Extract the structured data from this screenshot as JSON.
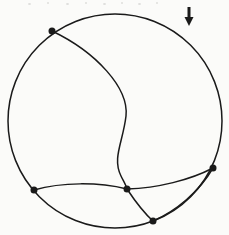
{
  "figure": {
    "name": "circle-graph-diagram",
    "background_color": "#fbfbf9",
    "ink_color": "#1a1a1a",
    "stroke_width": 1.5,
    "canvas": {
      "width": 229,
      "height": 235
    }
  },
  "boundary_circle": {
    "label": "outer-circle",
    "center_x": 115,
    "center_y": 121,
    "radius": 107,
    "stroke_width": 1.5
  },
  "vertices": [
    {
      "id": "v1",
      "label": "top-left-vertex",
      "x": 52,
      "y": 31,
      "size": 7
    },
    {
      "id": "v2",
      "label": "right-vertex",
      "x": 213,
      "y": 168,
      "size": 7
    },
    {
      "id": "v3",
      "label": "bottom-left-vertex",
      "x": 34,
      "y": 190,
      "size": 7
    },
    {
      "id": "v4",
      "label": "center-bottom-vertex",
      "x": 127,
      "y": 189,
      "size": 7
    },
    {
      "id": "v5",
      "label": "bottom-vertex",
      "x": 153,
      "y": 221,
      "size": 7
    }
  ],
  "edges": [
    {
      "id": "e1",
      "label": "interior-s-curve-v1-to-v4",
      "from": "v1",
      "to": "v4",
      "path": "M 52 31 C 96 52, 129 88, 126 116 C 123 142, 112 158, 121 176 C 124 182, 126 185, 127 189"
    },
    {
      "id": "e2",
      "label": "chord-v3-to-v4",
      "from": "v3",
      "to": "v4",
      "path": "M 34 190 C 62 182, 98 182, 127 189"
    },
    {
      "id": "e3",
      "label": "chord-v4-to-v2",
      "from": "v4",
      "to": "v2",
      "path": "M 127 189 C 158 188, 190 180, 213 168"
    },
    {
      "id": "e4",
      "label": "arc-v4-to-v5",
      "from": "v4",
      "to": "v5",
      "path": "M 127 189 C 135 201, 144 213, 153 221"
    },
    {
      "id": "e5",
      "label": "arc-v5-to-v2",
      "from": "v5",
      "to": "v2",
      "path": "M 153 221 C 176 211, 199 192, 213 168"
    }
  ],
  "annotations": [
    {
      "id": "a1",
      "label": "down-arrow-marker",
      "icon": "arrow-down-icon",
      "x": 189,
      "y_top": 7,
      "y_bottom": 26,
      "head_width": 9,
      "shaft_width": 3
    }
  ],
  "scan_artifacts": {
    "label": "faint-scan-specks",
    "color": "#c9c9c4",
    "specks": [
      {
        "x": 28,
        "y": 3,
        "w": 3,
        "h": 2
      },
      {
        "x": 47,
        "y": 2,
        "w": 2,
        "h": 2
      },
      {
        "x": 66,
        "y": 3,
        "w": 3,
        "h": 2
      },
      {
        "x": 85,
        "y": 2,
        "w": 2,
        "h": 2
      },
      {
        "x": 103,
        "y": 3,
        "w": 3,
        "h": 2
      },
      {
        "x": 121,
        "y": 2,
        "w": 2,
        "h": 2
      },
      {
        "x": 138,
        "y": 3,
        "w": 3,
        "h": 2
      },
      {
        "x": 156,
        "y": 2,
        "w": 2,
        "h": 2
      }
    ]
  }
}
